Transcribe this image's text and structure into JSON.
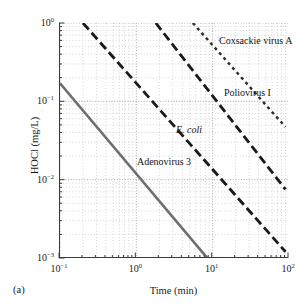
{
  "figure": {
    "panel_label": "(a)"
  },
  "chart_data": {
    "type": "line",
    "title": "",
    "subtitle": "",
    "xlabel": "Time (min)",
    "ylabel": "HOCl (mg/L)",
    "xscale": "log",
    "yscale": "log",
    "xlim": [
      0.1,
      100
    ],
    "ylim": [
      0.001,
      1
    ],
    "grid": true,
    "grid_style": "dotted minor and major gridlines",
    "legend_position": "inline labels next to each curve",
    "xticks": [
      0.1,
      1,
      10,
      100
    ],
    "xtick_labels": [
      "10⁻¹",
      "10⁰",
      "10¹",
      "10²"
    ],
    "xtick_mantissa": [
      "10",
      "10",
      "10",
      "10"
    ],
    "xtick_exponent": [
      "-1",
      "0",
      "1",
      "2"
    ],
    "yticks": [
      0.001,
      0.01,
      0.1,
      1
    ],
    "ytick_labels": [
      "10⁻³",
      "10⁻²",
      "10⁻¹",
      "10⁰"
    ],
    "ytick_mantissa": [
      "10",
      "10",
      "10",
      "10"
    ],
    "ytick_exponent": [
      "-3",
      "-2",
      "-1",
      "0"
    ],
    "series": [
      {
        "name": "Adenovirus 3",
        "label": "Adenovirus 3",
        "italic": false,
        "color": "#6e6e6e",
        "style": "solid",
        "stroke_width": 2.6,
        "x": [
          0.1,
          8.5
        ],
        "y": [
          0.17,
          0.001
        ],
        "label_x": 1.05,
        "label_y": 0.0165
      },
      {
        "name": "E. coli",
        "label": "E. coli",
        "italic": true,
        "color": "#1a1a1a",
        "style": "dashed",
        "stroke_width": 2.8,
        "x": [
          0.2,
          90
        ],
        "y": [
          1.0,
          0.0012
        ],
        "label_x": 3.4,
        "label_y": 0.042
      },
      {
        "name": "Poliovirus I",
        "label": "Poliovirus I",
        "italic": false,
        "color": "#1a1a1a",
        "style": "dashed",
        "stroke_width": 2.8,
        "x": [
          1.8,
          90
        ],
        "y": [
          1.0,
          0.0075
        ],
        "label_x": 14.5,
        "label_y": 0.125
      },
      {
        "name": "Coxsackie virus A",
        "label": "Coxsackie virus A",
        "italic": false,
        "color": "#2b2b2b",
        "style": "dotted",
        "stroke_width": 2.4,
        "x": [
          5.5,
          90
        ],
        "y": [
          1.0,
          0.047
        ],
        "label_x": 12.5,
        "label_y": 0.58
      }
    ]
  }
}
